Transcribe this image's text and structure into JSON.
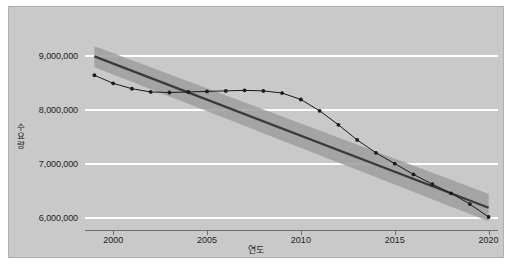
{
  "chart_data": {
    "type": "line",
    "title": "",
    "xlabel": "연도",
    "ylabel": "수요량",
    "xlim": [
      1998.5,
      2020.5
    ],
    "ylim": [
      5750000,
      9350000
    ],
    "grid": true,
    "grid_axis": "y",
    "legend": "none",
    "yticks": [
      6000000,
      7000000,
      8000000,
      9000000
    ],
    "ytick_labels": [
      "6,000,000",
      "7,000,000",
      "8,000,000",
      "9,000,000"
    ],
    "xticks": [
      2000,
      2005,
      2010,
      2015,
      2020
    ],
    "xtick_labels": [
      "2000",
      "2005",
      "2010",
      "2015",
      "2020"
    ],
    "series": [
      {
        "name": "observed",
        "style": "line-markers",
        "color": "#1a1a1a",
        "marker": "circle",
        "x": [
          1999,
          2000,
          2001,
          2002,
          2003,
          2004,
          2005,
          2006,
          2007,
          2008,
          2009,
          2010,
          2011,
          2012,
          2013,
          2014,
          2015,
          2016,
          2017,
          2018,
          2019,
          2020
        ],
        "values": [
          8640000,
          8490000,
          8390000,
          8330000,
          8320000,
          8330000,
          8340000,
          8350000,
          8360000,
          8350000,
          8310000,
          8190000,
          7980000,
          7720000,
          7440000,
          7200000,
          7000000,
          6800000,
          6620000,
          6450000,
          6250000,
          6010000
        ]
      },
      {
        "name": "trend",
        "style": "line",
        "color": "#3d3d3d",
        "x": [
          1999,
          2020
        ],
        "values": [
          8990000,
          6180000
        ]
      },
      {
        "name": "confidence-band",
        "style": "band",
        "color": "#9a9a9a",
        "x": [
          1999,
          2020
        ],
        "upper": [
          9180000,
          6440000
        ],
        "lower": [
          8790000,
          5930000
        ]
      }
    ]
  },
  "figure": {
    "background_color": "#c9c9c9",
    "gridline_color": "#ffffff",
    "axis_color": "#6d6d6d",
    "text_color": "#1d1d1d"
  }
}
